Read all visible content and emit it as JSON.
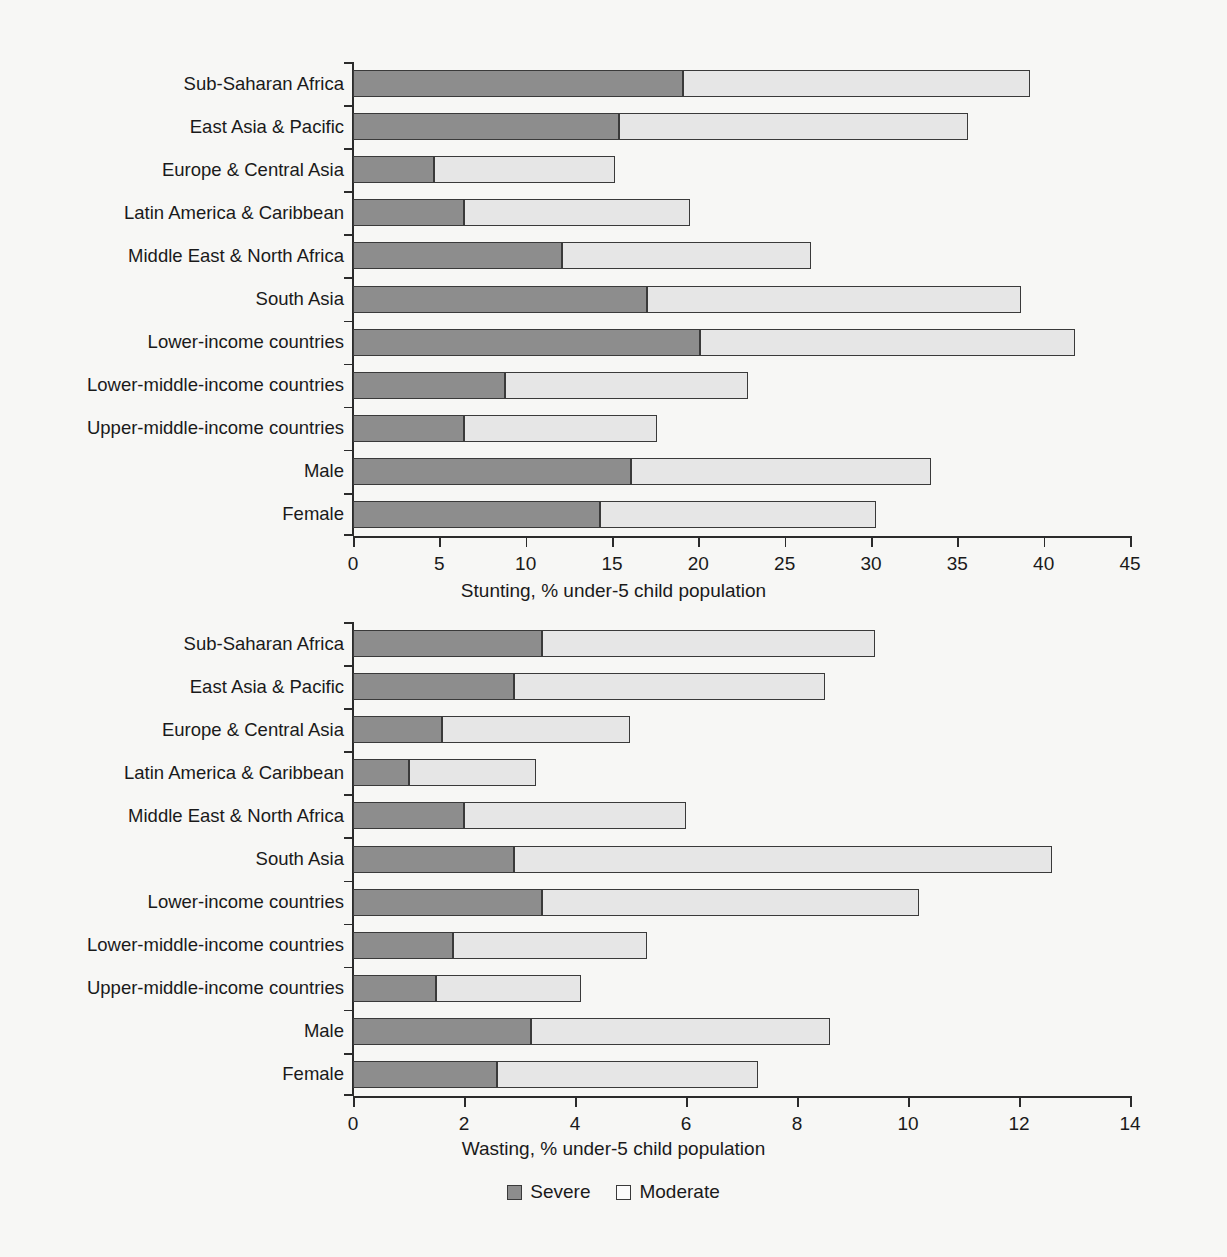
{
  "legend": {
    "items": [
      {
        "label": "Severe",
        "color": "#8d8d8d",
        "key": "severe"
      },
      {
        "label": "Moderate",
        "color": "#e6e6e6",
        "key": "moderate"
      }
    ]
  },
  "categories": [
    "Sub-Saharan Africa",
    "East Asia & Pacific",
    "Europe & Central Asia",
    "Latin America & Caribbean",
    "Middle East & North Africa",
    "South Asia",
    "Lower-income countries",
    "Lower-middle-income countries",
    "Upper-middle-income countries",
    "Male",
    "Female"
  ],
  "chart_data": [
    {
      "type": "bar",
      "orientation": "horizontal",
      "stacked": true,
      "title": "",
      "xlabel": "Stunting, % under-5 child population",
      "ylabel": "",
      "xlim": [
        0,
        45
      ],
      "xticks": [
        0,
        5,
        10,
        15,
        20,
        25,
        30,
        35,
        40,
        45
      ],
      "grid": false,
      "legend_position": "bottom",
      "categories": [
        "Sub-Saharan Africa",
        "East Asia & Pacific",
        "Europe & Central Asia",
        "Latin America & Caribbean",
        "Middle East & North Africa",
        "South Asia",
        "Lower-income countries",
        "Lower-middle-income countries",
        "Upper-middle-income countries",
        "Male",
        "Female"
      ],
      "series": [
        {
          "name": "Severe",
          "color": "#8d8d8d",
          "values": [
            19.1,
            15.4,
            4.7,
            6.4,
            12.1,
            17.0,
            20.1,
            8.8,
            6.4,
            16.1,
            14.3
          ]
        },
        {
          "name": "Moderate",
          "color": "#e6e6e6",
          "values": [
            20.1,
            20.2,
            10.5,
            13.1,
            14.4,
            21.7,
            21.7,
            14.1,
            11.2,
            17.4,
            16.0
          ]
        }
      ],
      "totals": [
        39.2,
        35.6,
        15.2,
        19.5,
        26.5,
        38.7,
        41.8,
        22.9,
        17.6,
        33.5,
        30.3
      ]
    },
    {
      "type": "bar",
      "orientation": "horizontal",
      "stacked": true,
      "title": "",
      "xlabel": "Wasting, % under-5 child population",
      "ylabel": "",
      "xlim": [
        0,
        14
      ],
      "xticks": [
        0,
        2,
        4,
        6,
        8,
        10,
        12,
        14
      ],
      "grid": false,
      "legend_position": "bottom",
      "categories": [
        "Sub-Saharan Africa",
        "East Asia & Pacific",
        "Europe & Central Asia",
        "Latin America & Caribbean",
        "Middle East & North Africa",
        "South Asia",
        "Lower-income countries",
        "Lower-middle-income countries",
        "Upper-middle-income countries",
        "Male",
        "Female"
      ],
      "series": [
        {
          "name": "Severe",
          "color": "#8d8d8d",
          "values": [
            3.4,
            2.9,
            1.6,
            1.0,
            2.0,
            2.9,
            3.4,
            1.8,
            1.5,
            3.2,
            2.6
          ]
        },
        {
          "name": "Moderate",
          "color": "#e6e6e6",
          "values": [
            6.0,
            5.6,
            3.4,
            2.3,
            4.0,
            9.7,
            6.8,
            3.5,
            2.6,
            5.4,
            4.7
          ]
        }
      ],
      "totals": [
        9.4,
        8.5,
        5.0,
        3.3,
        6.0,
        12.6,
        10.2,
        5.3,
        4.1,
        8.6,
        7.3
      ]
    }
  ]
}
